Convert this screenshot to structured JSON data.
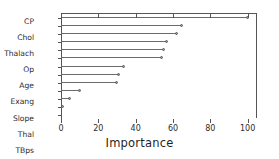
{
  "chart_data": {
    "type": "bar",
    "subtype": "lollipop-horizontal",
    "title": "",
    "xlabel": "Importance",
    "ylabel": "",
    "xlim": [
      0,
      105
    ],
    "ylim": null,
    "grid": false,
    "legend": null,
    "orientation": "horizontal",
    "xticks": [
      0,
      20,
      40,
      60,
      80,
      100
    ],
    "xticklabels": [
      "0",
      "20",
      "40",
      "60",
      "80",
      "100"
    ],
    "categories": [
      "CP",
      "Chol",
      "Thalach",
      "Op",
      "Age",
      "Exang",
      "Slope",
      "Thal",
      "TBps",
      "Ca",
      "Gender",
      "Recg",
      "Fbs"
    ],
    "values": [
      100,
      65,
      62,
      57,
      55,
      54,
      34,
      31,
      30,
      10,
      5,
      1,
      0
    ],
    "marker": "circle",
    "marker_color": "#9a9a9a",
    "line_color": "#6b6b6b",
    "axis_color": "#555555",
    "background": "#ffffff"
  }
}
